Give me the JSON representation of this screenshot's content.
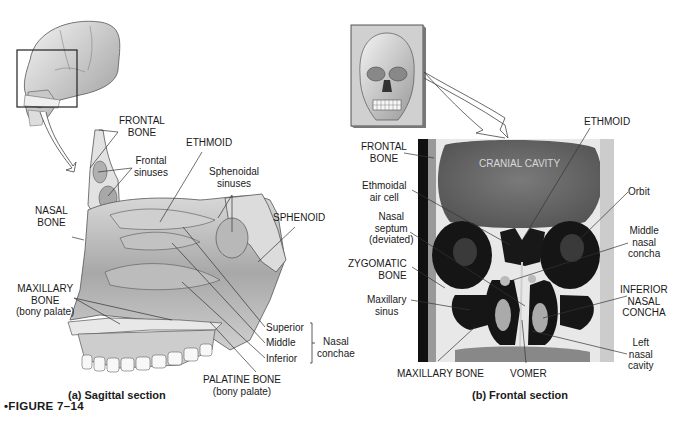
{
  "figure": {
    "label": "•FIGURE 7–14"
  },
  "panel_a": {
    "caption": "(a) Sagittal section",
    "labels": {
      "frontal_bone": [
        "FRONTAL",
        "BONE"
      ],
      "frontal_sinuses": [
        "Frontal",
        "sinuses"
      ],
      "ethmoid": "ETHMOID",
      "sphenoidal_sinuses": [
        "Sphenoidal",
        "sinuses"
      ],
      "nasal_bone": [
        "NASAL",
        "BONE"
      ],
      "sphenoid": "SPHENOID",
      "maxillary_bone": [
        "MAXILLARY",
        "BONE",
        "(bony palate)"
      ],
      "superior": "Superior",
      "middle": "Middle",
      "inferior": "Inferior",
      "nasal_conchae": [
        "Nasal",
        "conchae"
      ],
      "palatine_bone": [
        "PALATINE BONE",
        "(bony palate)"
      ]
    }
  },
  "panel_b": {
    "caption": "(b) Frontal section",
    "labels": {
      "ethmoid": "ETHMOID",
      "frontal_bone": [
        "FRONTAL",
        "BONE"
      ],
      "cranial_cavity": "CRANIAL CAVITY",
      "ethmoidal_air_cell": [
        "Ethmoidal",
        "air cell"
      ],
      "orbit": "Orbit",
      "nasal_septum": [
        "Nasal",
        "septum",
        "(deviated)"
      ],
      "middle_nasal_concha": [
        "Middle",
        "nasal",
        "concha"
      ],
      "zygomatic_bone": [
        "ZYGOMATIC",
        "BONE"
      ],
      "inferior_nasal_concha": [
        "INFERIOR",
        "NASAL",
        "CONCHA"
      ],
      "maxillary_sinus": [
        "Maxillary",
        "sinus"
      ],
      "left_nasal_cavity": [
        "Left",
        "nasal",
        "cavity"
      ],
      "maxillary_bone": "MAXILLARY BONE",
      "vomer": "VOMER"
    }
  },
  "colors": {
    "line": "#333333",
    "bone_light": "#e6e6e6",
    "bone_mid": "#bdbdbd",
    "ct_gray": "#6e6e6e",
    "ct_dark": "#111111",
    "ct_white": "#f2f2f2"
  }
}
